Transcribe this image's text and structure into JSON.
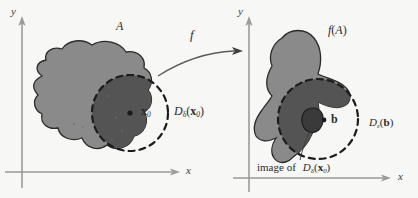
{
  "figure": {
    "background_color": "#f7f7f5",
    "blob_fill": "#8a8a8a",
    "blob_intersection_fill": "#545454",
    "inner_image_fill": "#3a3a3a",
    "outline_color": "#2b2b2b",
    "axis_color": "#9a9a9a",
    "dashed_circle_color": "#1c1c1c"
  },
  "left_panel": {
    "axis_x_label": "x",
    "axis_y_label": "y",
    "set_label": "A",
    "point_label": "x",
    "point_subscript": "0",
    "disk_label_base": "D",
    "disk_label_subscript": "δ",
    "disk_label_arg_base": "x",
    "disk_label_arg_subscript": "0",
    "disk_label_open": "(",
    "disk_label_close": ")"
  },
  "map": {
    "label": "f",
    "arrow_name": "curved-arrow"
  },
  "right_panel": {
    "axis_x_label": "x",
    "axis_y_label": "y",
    "image_set_label_f": "f",
    "image_set_label_open": "(",
    "image_set_label_arg": "A",
    "image_set_label_close": ")",
    "point_label": "b",
    "disk_label_base": "D",
    "disk_label_subscript": "ε",
    "disk_label_arg": "b",
    "disk_label_open": "(",
    "disk_label_close": ")",
    "caption_prefix": "image of",
    "caption_disk_base": "D",
    "caption_disk_subscript": "δ",
    "caption_disk_arg_base": "x",
    "caption_disk_arg_subscript": "0",
    "caption_open": "(",
    "caption_close": ")"
  }
}
